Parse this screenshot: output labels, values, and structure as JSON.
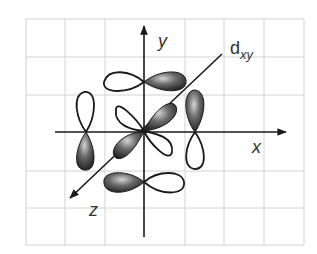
{
  "diagram": {
    "orbital_label": {
      "main": "d",
      "subscript": "xy"
    },
    "axes": {
      "x": {
        "label": "x"
      },
      "y": {
        "label": "y"
      },
      "z": {
        "label": "z"
      }
    },
    "grid": {
      "columns": 7,
      "rows": 6,
      "line_color": "#cfcfcf"
    },
    "colors": {
      "axis": "#2a2a2a",
      "lobe_outline": "#1a1a1a",
      "lobe_dark": "#3a3a3a",
      "lobe_light": "#bdbdbd",
      "lobe_empty": "#ffffff"
    }
  }
}
